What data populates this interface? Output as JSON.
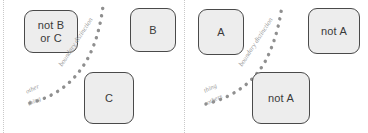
{
  "figure": {
    "background_color": "#ffffff",
    "node_fill_color": "#ededed",
    "node_border_color": "#4a4a4a",
    "dot_color": "#8f8f8f",
    "annotation_color": "#9a9a9a",
    "rule_color": "#c9c9c9"
  },
  "panels": [
    {
      "id": "left-panel",
      "nodes": [
        {
          "id": "not-b-or-c",
          "label": "not B\nor C"
        },
        {
          "id": "b",
          "label": "B"
        },
        {
          "id": "c",
          "label": "C"
        }
      ],
      "curve_label": "boundary distinction",
      "end_labels": [
        "other",
        "thing"
      ]
    },
    {
      "id": "right-panel",
      "nodes": [
        {
          "id": "a",
          "label": "A"
        },
        {
          "id": "not-a-1",
          "label": "not A"
        },
        {
          "id": "not-a-2",
          "label": "not A"
        }
      ],
      "curve_label": "boundary distinction",
      "end_labels": [
        "thing",
        "others"
      ]
    }
  ]
}
